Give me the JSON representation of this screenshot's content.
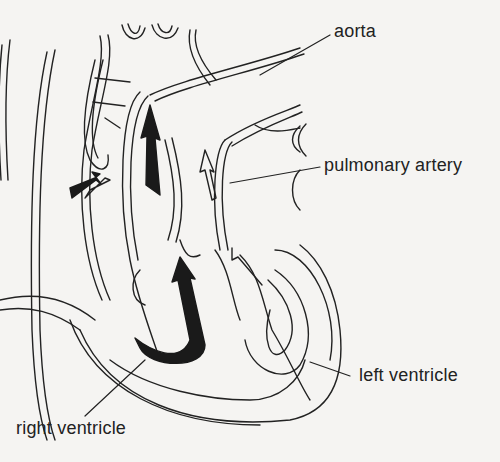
{
  "diagram": {
    "labels": {
      "aorta": "aorta",
      "pulmonary_artery": "pulmonary artery",
      "left_ventricle": "left ventricle",
      "right_ventricle": "right ventricle"
    },
    "colors": {
      "line": "#222222",
      "fill_dark": "#1a1a1a",
      "background": "#f5f4f2"
    }
  }
}
